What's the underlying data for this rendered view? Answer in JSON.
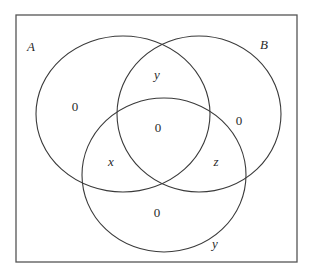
{
  "diagram": {
    "type": "venn",
    "universe": {
      "x": 16,
      "y": 15,
      "width": 281,
      "height": 247
    },
    "sets": [
      {
        "id": "A",
        "label": "A",
        "cx": 123,
        "cy": 114,
        "rx": 87,
        "ry": 78,
        "label_x": 31,
        "label_y": 51
      },
      {
        "id": "B",
        "label": "B",
        "cx": 199,
        "cy": 114,
        "rx": 82,
        "ry": 78,
        "label_x": 264,
        "label_y": 49
      },
      {
        "id": "C",
        "label": "y",
        "cx": 164,
        "cy": 175,
        "rx": 82,
        "ry": 77,
        "label_x": 215,
        "label_y": 248
      }
    ],
    "regions": [
      {
        "name": "A-only",
        "value": "0",
        "x": 75,
        "y": 111,
        "italic": false
      },
      {
        "name": "B-only",
        "value": "0",
        "x": 239,
        "y": 125,
        "italic": false
      },
      {
        "name": "A-and-B-only",
        "value": "y",
        "x": 157,
        "y": 79,
        "italic": true
      },
      {
        "name": "A-and-B-and-C",
        "value": "0",
        "x": 158,
        "y": 132,
        "italic": false
      },
      {
        "name": "A-and-C-only",
        "value": "x",
        "x": 111,
        "y": 166,
        "italic": true
      },
      {
        "name": "B-and-C-only",
        "value": "z",
        "x": 216,
        "y": 166,
        "italic": true
      },
      {
        "name": "C-only",
        "value": "0",
        "x": 157,
        "y": 217,
        "italic": false
      }
    ],
    "colors": {
      "stroke": "#3a3a3a",
      "frame": "#555555",
      "text": "#2a2a2a",
      "background": "#ffffff"
    }
  }
}
